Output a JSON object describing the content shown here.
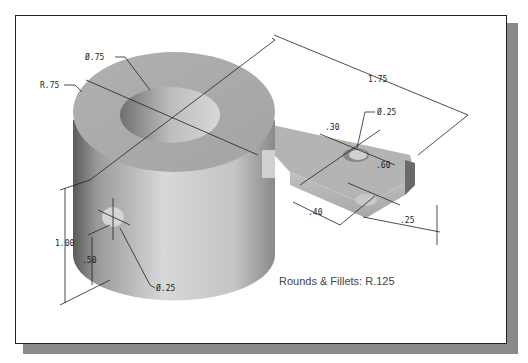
{
  "drawing": {
    "title": "Isometric part drawing",
    "dimensions": {
      "hole_top_diameter": "Ø.75",
      "outer_radius": "R.75",
      "overall_length": "1.75",
      "arm_hole_diameter": "Ø.25",
      "arm_hole_offset": ".30",
      "arm_width": ".60",
      "arm_hole_to_end": ".40",
      "arm_thickness": ".25",
      "height": "1.00",
      "side_hole_height": ".50",
      "side_hole_diameter": "Ø.25"
    },
    "note": "Rounds & Fillets: R.125"
  }
}
